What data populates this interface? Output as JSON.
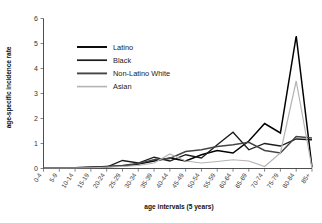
{
  "chart_data": {
    "type": "line",
    "title": "",
    "xlabel": "age intervals (5 years)",
    "ylabel": "age-specific incidence rate",
    "xlim": [
      0,
      17
    ],
    "ylim": [
      0,
      6
    ],
    "yticks": [
      0,
      1,
      2,
      3,
      4,
      5,
      6
    ],
    "grid": false,
    "legend_position": "upper-center",
    "categories": [
      "0-4",
      "5-9",
      "10-14",
      "15-19",
      "20-24",
      "25-29",
      "30-34",
      "35-39",
      "40-44",
      "45-49",
      "50-54",
      "55-59",
      "60-64",
      "65-69",
      "70-74",
      "75-79",
      "80-84",
      "85+"
    ],
    "series": [
      {
        "name": "Latino",
        "color": "#000000",
        "width": 1.5,
        "values": [
          0.02,
          0.02,
          0.03,
          0.05,
          0.08,
          0.1,
          0.18,
          0.3,
          0.42,
          0.3,
          0.55,
          0.72,
          0.62,
          1.1,
          1.8,
          1.42,
          5.3,
          0.05
        ]
      },
      {
        "name": "Black",
        "color": "#1c1c1c",
        "width": 1.3,
        "values": [
          0.02,
          0.02,
          0.02,
          0.04,
          0.06,
          0.32,
          0.22,
          0.45,
          0.3,
          0.55,
          0.42,
          0.95,
          1.45,
          0.75,
          1.0,
          0.9,
          1.18,
          1.15
        ]
      },
      {
        "name": "Non-Latino White",
        "color": "#454545",
        "width": 1.5,
        "values": [
          0.02,
          0.02,
          0.03,
          0.05,
          0.07,
          0.12,
          0.2,
          0.35,
          0.4,
          0.68,
          0.75,
          0.88,
          0.95,
          1.05,
          0.72,
          0.62,
          1.28,
          1.22
        ]
      },
      {
        "name": "Asian",
        "color": "#b4b4b4",
        "width": 1.2,
        "values": [
          0.02,
          0.02,
          0.02,
          0.03,
          0.05,
          0.08,
          0.12,
          0.22,
          0.58,
          0.3,
          0.22,
          0.28,
          0.35,
          0.3,
          0.08,
          0.62,
          3.5,
          0.02
        ]
      }
    ]
  },
  "legend": {
    "items": [
      {
        "label": "Latino"
      },
      {
        "label": "Black"
      },
      {
        "label": "Non-Latino White"
      },
      {
        "label": "Asian"
      }
    ]
  }
}
